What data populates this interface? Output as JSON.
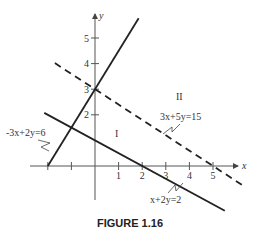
{
  "figure": {
    "caption": "FIGURE 1.16",
    "axes": {
      "x_label": "x",
      "y_label": "y",
      "x_ticks": [
        -2,
        -1,
        1,
        2,
        3,
        4,
        5
      ],
      "x_tick_labels": [
        "1",
        "2",
        "3",
        "4",
        "5"
      ],
      "y_ticks": [
        2,
        3,
        4,
        5
      ],
      "y_tick_labels": [
        "2",
        "3",
        "4",
        "5"
      ]
    },
    "lines": [
      {
        "equation": "-3x+2y=6",
        "style": "solid",
        "a": -3,
        "b": 2,
        "c": 6
      },
      {
        "equation": "x+2y=2",
        "style": "solid",
        "a": 1,
        "b": 2,
        "c": 2
      },
      {
        "equation": "3x+5y=15",
        "style": "dashed",
        "a": 3,
        "b": 5,
        "c": 15
      }
    ],
    "regions": [
      {
        "label": "I"
      },
      {
        "label": "II"
      }
    ],
    "color": "#222222"
  }
}
